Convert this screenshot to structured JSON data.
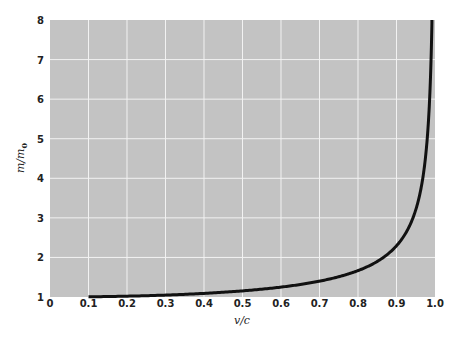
{
  "chart_data": {
    "type": "line",
    "title": "",
    "xlabel": "v/c",
    "ylabel": "m/m0",
    "xlim": [
      0,
      1.0
    ],
    "ylim": [
      1,
      8
    ],
    "grid": true,
    "legend": null,
    "x_ticks": [
      "0",
      "0.1",
      "0.2",
      "0.3",
      "0.4",
      "0.5",
      "0.6",
      "0.7",
      "0.8",
      "0.9",
      "1.0"
    ],
    "y_ticks": [
      "1",
      "2",
      "3",
      "4",
      "5",
      "6",
      "7",
      "8"
    ],
    "series": [
      {
        "name": "m/m0 = 1/sqrt(1-(v/c)^2)",
        "x": [
          0.1,
          0.2,
          0.3,
          0.4,
          0.5,
          0.6,
          0.7,
          0.8,
          0.85,
          0.9,
          0.93,
          0.95,
          0.97,
          0.98,
          0.99,
          0.992
        ],
        "y": [
          1.005,
          1.021,
          1.048,
          1.091,
          1.155,
          1.25,
          1.4,
          1.667,
          1.898,
          2.294,
          2.721,
          3.203,
          4.113,
          5.025,
          7.089,
          7.93
        ]
      }
    ],
    "colors": {
      "plot_bg": "#c3c3c3",
      "grid": "#f2f2f2",
      "line": "#111111"
    }
  }
}
